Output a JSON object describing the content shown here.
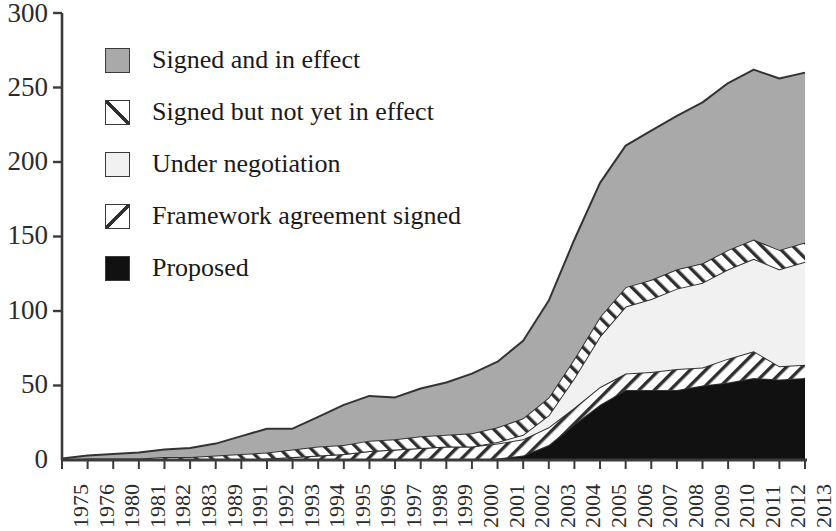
{
  "chart_data": {
    "type": "area",
    "title": "",
    "subtitle": "",
    "xlabel": "",
    "ylabel": "",
    "stacked": true,
    "grid": false,
    "legend_position": "inside-top-left",
    "ylim": [
      0,
      300
    ],
    "yticks": [
      0,
      50,
      100,
      150,
      200,
      250,
      300
    ],
    "categories": [
      "1975",
      "1976",
      "1980",
      "1981",
      "1982",
      "1983",
      "1989",
      "1991",
      "1992",
      "1993",
      "1994",
      "1995",
      "1996",
      "1997",
      "1998",
      "1999",
      "2000",
      "2001",
      "2002",
      "2003",
      "2004",
      "2005",
      "2006",
      "2007",
      "2008",
      "2009",
      "2010",
      "2011",
      "2012",
      "2013"
    ],
    "series": [
      {
        "name": "Proposed",
        "color": "#111111",
        "pattern": "solid",
        "values": [
          0,
          0,
          0,
          0,
          0,
          0,
          0,
          0,
          0,
          0,
          0,
          0,
          0,
          0,
          0,
          0,
          0,
          1,
          3,
          10,
          24,
          37,
          47,
          47,
          47,
          50,
          52,
          55,
          54,
          55
        ]
      },
      {
        "name": "Framework agreement signed",
        "color": "#ffffff",
        "pattern": "forward-diagonal",
        "values": [
          0,
          0,
          0,
          0,
          0,
          0,
          0,
          0,
          1,
          2,
          3,
          4,
          6,
          7,
          8,
          9,
          9,
          10,
          11,
          12,
          11,
          12,
          11,
          12,
          14,
          12,
          16,
          18,
          9,
          9
        ]
      },
      {
        "name": "Under negotiation",
        "color": "#f1f1f1",
        "pattern": "solid",
        "values": [
          0,
          0,
          0,
          0,
          0,
          0,
          0,
          0,
          0,
          0,
          0,
          0,
          0,
          0,
          0,
          0,
          0,
          1,
          3,
          8,
          20,
          34,
          45,
          49,
          54,
          57,
          60,
          62,
          65,
          69
        ]
      },
      {
        "name": "Signed but not yet in effect",
        "color": "#ffffff",
        "pattern": "back-diagonal",
        "values": [
          0,
          1,
          1,
          1,
          2,
          2,
          3,
          4,
          4,
          5,
          6,
          6,
          7,
          7,
          8,
          8,
          9,
          10,
          11,
          12,
          13,
          13,
          13,
          13,
          13,
          13,
          13,
          13,
          13,
          13
        ]
      },
      {
        "name": "Signed and in effect",
        "color": "#a9a9a9",
        "pattern": "solid",
        "values": [
          1,
          2,
          3,
          4,
          5,
          6,
          8,
          12,
          16,
          14,
          20,
          27,
          30,
          28,
          32,
          35,
          40,
          44,
          52,
          65,
          80,
          90,
          95,
          100,
          103,
          108,
          112,
          114,
          115,
          114
        ]
      }
    ],
    "totals": [
      1,
      3,
      4,
      5,
      7,
      8,
      11,
      16,
      21,
      21,
      29,
      37,
      43,
      42,
      48,
      52,
      58,
      66,
      80,
      107,
      148,
      186,
      211,
      221,
      231,
      240,
      253,
      262,
      256,
      260
    ]
  },
  "legend": {
    "items": [
      {
        "label": "Signed and in effect",
        "swatch": "solid-gray"
      },
      {
        "label": "Signed but not yet in effect",
        "swatch": "back-diagonal"
      },
      {
        "label": "Under negotiation",
        "swatch": "solid-lightgray"
      },
      {
        "label": "Framework agreement signed",
        "swatch": "forward-diagonal"
      },
      {
        "label": "Proposed",
        "swatch": "solid-black"
      }
    ]
  },
  "colors": {
    "signed_in_effect": "#a9a9a9",
    "under_negotiation": "#f1f1f1",
    "proposed": "#111111",
    "hatch_fill": "#ffffff",
    "outline": "#333333",
    "axis": "#3b3b3b",
    "text": "#1a1a1a"
  }
}
